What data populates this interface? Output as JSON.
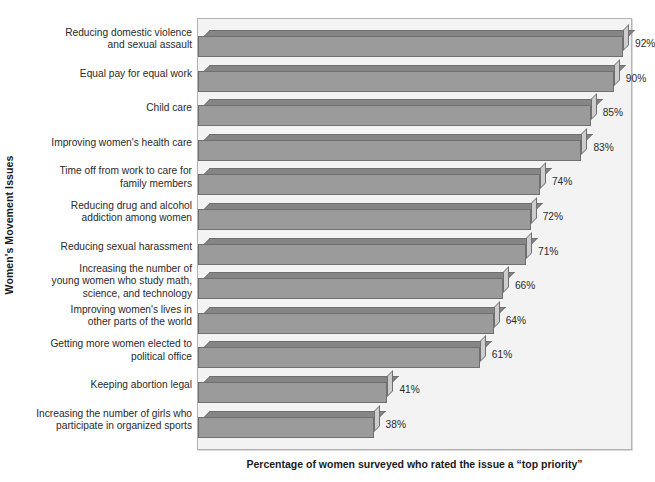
{
  "chart_data": {
    "type": "bar",
    "orientation": "horizontal",
    "title": "",
    "xlabel": "Percentage of women surveyed who rated the issue a “top priority”",
    "ylabel": "Women's Movement Issues",
    "xlim": [
      0,
      100
    ],
    "grid": false,
    "legend": null,
    "value_suffix": "%",
    "categories": [
      "Reducing domestic violence and sexual assault",
      "Equal pay for equal work",
      "Child care",
      "Improving women's health care",
      "Time off from work to care for family members",
      "Reducing drug and alcohol addiction among women",
      "Reducing sexual harassment",
      "Increasing the number of young women who study math, science, and technology",
      "Improving women's lives in other parts of the world",
      "Getting more women elected to political office",
      "Keeping abortion legal",
      "Increasing the number of girls who participate in organized sports"
    ],
    "values": [
      92,
      90,
      85,
      83,
      74,
      72,
      71,
      66,
      64,
      61,
      41,
      38
    ],
    "value_labels": [
      "92%",
      "90%",
      "85%",
      "83%",
      "74%",
      "72%",
      "71%",
      "66%",
      "64%",
      "61%",
      "41%",
      "38%"
    ],
    "category_lines": [
      [
        "Reducing domestic violence",
        "and sexual assault"
      ],
      [
        "Equal pay for equal work"
      ],
      [
        "Child care"
      ],
      [
        "Improving women's health care"
      ],
      [
        "Time off from work to care for",
        "family members"
      ],
      [
        "Reducing drug and alcohol",
        "addiction among women"
      ],
      [
        "Reducing sexual harassment"
      ],
      [
        "Increasing the number of",
        "young women who study math,",
        "science, and technology"
      ],
      [
        "Improving women's lives in",
        "other parts of the world"
      ],
      [
        "Getting more women elected to",
        "political office"
      ],
      [
        "Keeping abortion legal"
      ],
      [
        "Increasing the number of girls who",
        "participate in organized sports"
      ]
    ],
    "colors": {
      "bar_front": "#9b9b9b",
      "bar_top": "#858585",
      "bar_side": "#cdcdcd",
      "bar_outline": "#6f6f6f",
      "plot_background": "#f3f3f3",
      "plot_border": "#b4b4b4",
      "text": "#2a2a2a",
      "axis_title": "#1b1b1b"
    }
  }
}
